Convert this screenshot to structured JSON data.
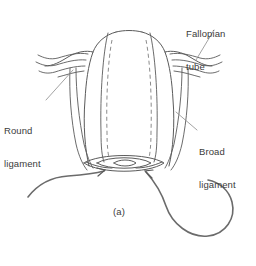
{
  "figure": {
    "kind": "anatomical-line-drawing",
    "caption": "(a)",
    "background_color": "#ffffff",
    "line_color": "#5a5a5a",
    "dashed_line_color": "#8c8c8c",
    "suture_color": "#6b6b6b",
    "text_color": "#3b3b3b",
    "labels": [
      {
        "id": "fallopian-tube",
        "line1": "Fallopian",
        "line2": "tube",
        "position": "top-right",
        "leader_from": [
          218,
          30
        ],
        "leader_to": [
          192,
          58
        ]
      },
      {
        "id": "round-ligament",
        "line1": "Round",
        "line2": "ligament",
        "position": "left",
        "leader_from": [
          45,
          100
        ],
        "leader_to": [
          74,
          70
        ]
      },
      {
        "id": "broad-ligament",
        "line1": "Broad",
        "line2": "ligament",
        "position": "right",
        "leader_from": [
          197,
          130
        ],
        "leader_to": [
          174,
          112
        ]
      }
    ],
    "structures": [
      "uterine-fundus",
      "uterine-body",
      "left-fallopian-tube",
      "right-fallopian-tube",
      "round-ligament-left",
      "broad-ligament-right",
      "cervix-vaginal-cuff",
      "midline-dashed-incision-left",
      "midline-dashed-incision-right",
      "suture-left",
      "suture-right-loop"
    ],
    "arrows": [
      {
        "id": "suture-arrow-left",
        "tip": [
          104,
          171
        ],
        "direction": "up-right"
      },
      {
        "id": "suture-arrow-right",
        "tip": [
          146,
          172
        ],
        "direction": "up-left"
      }
    ]
  }
}
